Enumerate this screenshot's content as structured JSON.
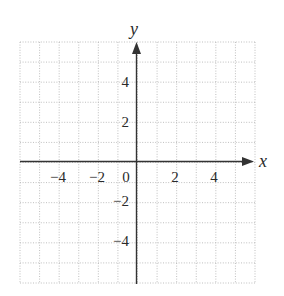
{
  "chart_data": {
    "type": "coordinate-grid",
    "title": "",
    "xlabel": "x",
    "ylabel": "y",
    "xlim": [
      -6,
      6
    ],
    "ylim": [
      -6,
      6
    ],
    "grid": true,
    "grid_style": "dotted",
    "grid_step": 1,
    "x_tick_labels": [
      "-4",
      "-2",
      "0",
      "2",
      "4"
    ],
    "x_tick_values": [
      -4,
      -2,
      0,
      2,
      4
    ],
    "y_tick_labels": [
      "4",
      "2",
      "-2",
      "-4"
    ],
    "y_tick_values": [
      4,
      2,
      -2,
      -4
    ],
    "legend": null,
    "series": []
  },
  "display": {
    "xlabel": "x",
    "ylabel": "y",
    "x_ticks": [
      "−4",
      "−2",
      "0",
      "2",
      "4"
    ],
    "y_ticks": [
      "4",
      "2",
      "−2",
      "−4"
    ]
  },
  "colors": {
    "grid": "#b8b8b8",
    "axis": "#333333",
    "text": "#2a2a2a"
  }
}
